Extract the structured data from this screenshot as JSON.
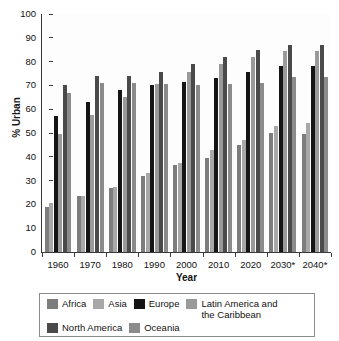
{
  "chart_data": {
    "type": "bar",
    "title": "",
    "xlabel": "Year",
    "ylabel": "% Urban",
    "ylim": [
      0,
      100
    ],
    "ytick_step": 10,
    "yticks": [
      100,
      90,
      80,
      70,
      60,
      50,
      40,
      30,
      20,
      10,
      0
    ],
    "grid": false,
    "legend_position": "bottom",
    "categories": [
      "1960",
      "1970",
      "1980",
      "1990",
      "2000",
      "2010",
      "2020",
      "2030*",
      "2040*"
    ],
    "series": [
      {
        "name": "Africa",
        "color": "#7d7d7d",
        "values": [
          19,
          23.5,
          27,
          32,
          36.5,
          39.5,
          45,
          50,
          49.5
        ]
      },
      {
        "name": "Asia",
        "color": "#a8a8a8",
        "values": [
          20.5,
          23.5,
          27.5,
          33,
          37.5,
          43,
          47,
          53,
          54
        ]
      },
      {
        "name": "Europe",
        "color": "#151515",
        "values": [
          57,
          63,
          68,
          70,
          71.5,
          73,
          75.5,
          78,
          78
        ]
      },
      {
        "name": "Latin America and\nthe Caribbean",
        "color": "#9a9a9a",
        "values": [
          49.5,
          57.5,
          65,
          70.5,
          75.5,
          79,
          82,
          84.5,
          84.5
        ]
      },
      {
        "name": "North America",
        "color": "#4a4a4a",
        "values": [
          70,
          74,
          74,
          75.5,
          79,
          82,
          85,
          87,
          87
        ]
      },
      {
        "name": "Oceania",
        "color": "#8b8b8b",
        "values": [
          67,
          71,
          71,
          70.5,
          70,
          70.5,
          71,
          73.5,
          73.5
        ]
      }
    ]
  },
  "axes": {
    "y_title": "% Urban",
    "x_title": "Year"
  }
}
